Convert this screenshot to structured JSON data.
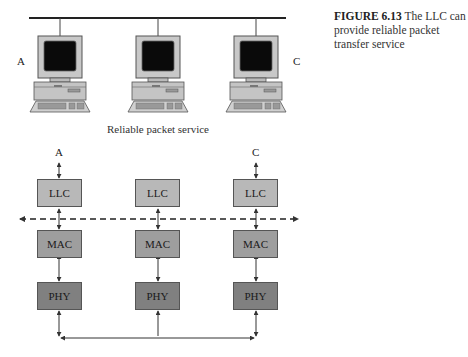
{
  "caption": {
    "figure_label": "FIGURE 6.13",
    "text": " The LLC can provide reliable packet transfer service"
  },
  "top_network": {
    "nodes": [
      {
        "id": "A",
        "label": "A"
      },
      {
        "id": "B",
        "label": ""
      },
      {
        "id": "C",
        "label": "C"
      }
    ],
    "service_label": "Reliable packet service"
  },
  "stack": {
    "endpoint_labels": {
      "left": "A",
      "right": "C"
    },
    "columns": [
      {
        "layers": [
          "LLC",
          "MAC",
          "PHY"
        ]
      },
      {
        "layers": [
          "LLC",
          "MAC",
          "PHY"
        ]
      },
      {
        "layers": [
          "LLC",
          "MAC",
          "PHY"
        ]
      }
    ],
    "colors": {
      "llc": "#b8b8b8",
      "mac": "#9e9e9e",
      "phy": "#808080"
    }
  }
}
